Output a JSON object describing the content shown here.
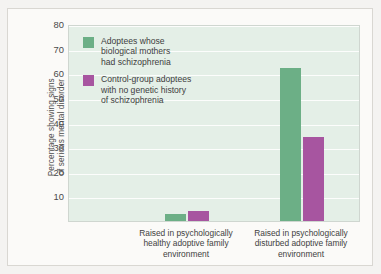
{
  "chart_data": {
    "type": "bar",
    "title": "",
    "subtitle": "",
    "xlabel": "",
    "ylabel": "Percentage showing signs\nof serious mental disorder",
    "ylim": [
      0,
      80
    ],
    "ytick_step": 10,
    "yticks": [
      80,
      70,
      60,
      50,
      40,
      30,
      20,
      10
    ],
    "grid": true,
    "legend_position": "inside-top-left",
    "categories": [
      "Raised in psychologically\nhealthy adoptive family\nenvironment",
      "Raised in psychologically\ndisturbed adoptive family\nenvironment"
    ],
    "series": [
      {
        "name": "Adoptees whose\nbiological mothers\nhad schizophrenia",
        "color": "#6CAF86",
        "values": [
          3,
          62
        ]
      },
      {
        "name": "Control-group adoptees\nwith no genetic history\nof schizophrenia",
        "color": "#A755A0",
        "values": [
          4,
          34
        ]
      }
    ]
  },
  "style": {
    "page_background": "#f4f3f1",
    "card_background": "#fbfaf8",
    "plot_background": "#e4efe7",
    "plot_border": "#cfd6d0",
    "gridline_color": "#fdfdfd",
    "text_color": "#3f3f3f",
    "green": "#6CAF86",
    "purple": "#A755A0"
  }
}
